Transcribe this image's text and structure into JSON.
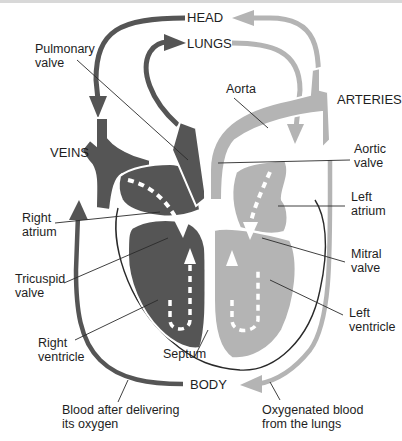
{
  "diagram": {
    "colors": {
      "deoxygenated": "#555555",
      "oxygenated": "#b4b4b4",
      "outline": "#2a2a2a",
      "background": "#ffffff",
      "text": "#1e1e1e"
    },
    "destinations": {
      "head": "HEAD",
      "lungs": "LUNGS",
      "body": "BODY",
      "arteries": "ARTERIES",
      "veins": "VEINS"
    },
    "labels": {
      "pulmonary_valve": [
        "Pulmonary",
        "valve"
      ],
      "aorta": "Aorta",
      "aortic_valve": [
        "Aortic",
        "valve"
      ],
      "left_atrium": [
        "Left",
        "atrium"
      ],
      "mitral_valve": [
        "Mitral",
        "valve"
      ],
      "left_ventricle": [
        "Left",
        "ventricle"
      ],
      "right_atrium": [
        "Right",
        "atrium"
      ],
      "tricuspid_valve": [
        "Tricuspid",
        "valve"
      ],
      "right_ventricle": [
        "Right",
        "ventricle"
      ],
      "septum": "Septum"
    },
    "captions": {
      "deoxygenated": [
        "Blood after delivering",
        "its oxygen"
      ],
      "oxygenated": [
        "Oxygenated blood",
        "from the lungs"
      ]
    }
  }
}
